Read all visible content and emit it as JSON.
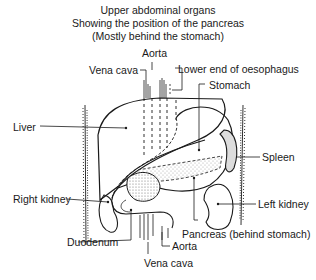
{
  "title": {
    "line1": "Upper abdominal organs",
    "line2": "Showing the position of the pancreas",
    "line3": "(Mostly behind the stomach)"
  },
  "labels": {
    "aorta_top": "Aorta",
    "vena_cava_top": "Vena cava",
    "oesophagus": "Lower end of oesophagus",
    "stomach": "Stomach",
    "liver": "Liver",
    "spleen": "Spleen",
    "left_kidney": "Left kidney",
    "right_kidney": "Right kidney",
    "pancreas": "Pancreas (behind stomach)",
    "duodenum": "Duodenum",
    "aorta_bottom": "Aorta",
    "vena_cava_bottom": "Vena cava"
  },
  "colors": {
    "line": "#1a1a1a",
    "background": "#ffffff",
    "stipple": "#bbbbbb"
  }
}
